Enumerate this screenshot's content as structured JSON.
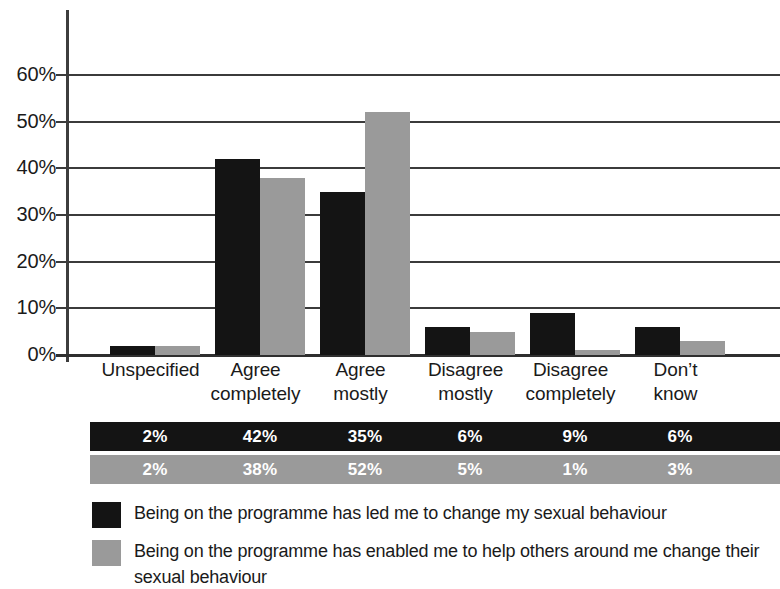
{
  "chart_data": {
    "type": "bar",
    "title": "",
    "subtitle": "",
    "xlabel": "",
    "ylabel": "",
    "ylim": [
      0,
      65
    ],
    "grid": true,
    "legend_position": "bottom-left",
    "categories": [
      "Unspecified",
      "Agree completely",
      "Agree mostly",
      "Disagree mostly",
      "Disagree completely",
      "Don't know"
    ],
    "category_lines": [
      [
        "Unspecified"
      ],
      [
        "Agree",
        "completely"
      ],
      [
        "Agree",
        "mostly"
      ],
      [
        "Disagree",
        "mostly"
      ],
      [
        "Disagree",
        "completely"
      ],
      [
        "Don’t",
        "know"
      ]
    ],
    "ytick_labels": [
      "60%",
      "50%",
      "40%",
      "30%",
      "20%",
      "10%",
      "0%"
    ],
    "ytick_values": [
      60,
      50,
      40,
      30,
      20,
      10,
      0
    ],
    "series": [
      {
        "name": "Being on the programme has led me to change my sexual behaviour",
        "color": "#141414",
        "values": [
          2,
          42,
          35,
          6,
          9,
          6
        ],
        "data_labels": [
          "2%",
          "42%",
          "35%",
          "6%",
          "9%",
          "6%"
        ],
        "bar_pixel_heights": [
          3,
          42,
          36,
          7,
          10,
          7
        ]
      },
      {
        "name": "Being on the programme has enabled me to help others around me change their sexual behaviour",
        "color": "#9a9a9a",
        "values": [
          2,
          38,
          52,
          5,
          1,
          3
        ],
        "data_labels": [
          "2%",
          "38%",
          "52%",
          "5%",
          "1%",
          "3%"
        ],
        "bar_pixel_heights": [
          3,
          38,
          53,
          6,
          1,
          3
        ]
      }
    ]
  },
  "legend": {
    "items": [
      {
        "swatch": "#141414",
        "label": "Being on the programme has led me to change my sexual behaviour"
      },
      {
        "swatch": "#9a9a9a",
        "label": "Being on the programme has enabled me to help others around me change their sexual behaviour"
      }
    ]
  },
  "colors": {
    "series_black": "#141414",
    "series_gray": "#9a9a9a",
    "axis": "#3d3d3d",
    "grid": "#3b3b3b",
    "text": "#1a1a1a",
    "background": "#ffffff"
  }
}
